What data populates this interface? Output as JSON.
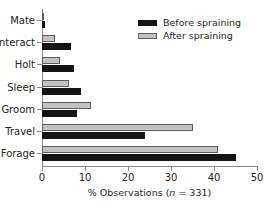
{
  "chart_data": {
    "type": "bar",
    "orientation": "horizontal",
    "title": "",
    "xlabel": "% Observations (n = 331)",
    "xlabel_plain": "% Observations (",
    "xlabel_italic": "n",
    "xlabel_tail": " = 331)",
    "ylabel": "",
    "categories": [
      "Mate",
      "Interact",
      "Holt",
      "Sleep",
      "Groom",
      "Travel",
      "Forage"
    ],
    "series": [
      {
        "name": "Before spraining",
        "color": "#141414",
        "values": [
          0.8,
          6.8,
          7.4,
          9.0,
          8.2,
          24.0,
          45.0
        ]
      },
      {
        "name": "After spraining",
        "color": "#c3c3c3",
        "values": [
          0.5,
          3.0,
          4.3,
          6.2,
          11.3,
          35.0,
          41.0
        ]
      }
    ],
    "xlim": [
      0,
      50
    ],
    "xticks": [
      0,
      10,
      20,
      30,
      40,
      50
    ],
    "xtick_labels": [
      "0",
      "10",
      "20",
      "30",
      "40",
      "50"
    ],
    "grid": false,
    "legend_position": "top-right",
    "n": 331
  },
  "legend": {
    "entries": [
      {
        "label": "Before spraining"
      },
      {
        "label": "After spraining"
      }
    ]
  }
}
